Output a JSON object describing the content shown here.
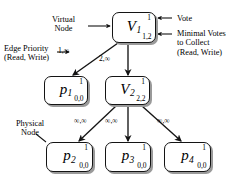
{
  "diagram": {
    "nodes": [
      {
        "id": "V1",
        "label": "V",
        "subscript": "1",
        "vote": "1",
        "minimal_votes": "1,2",
        "kind": "virtual"
      },
      {
        "id": "p1",
        "label": "p",
        "subscript": "1",
        "vote": "1",
        "minimal_votes": "0,0",
        "kind": "physical"
      },
      {
        "id": "V2",
        "label": "V",
        "subscript": "2",
        "vote": "1",
        "minimal_votes": "2,2",
        "kind": "virtual"
      },
      {
        "id": "p2",
        "label": "p",
        "subscript": "2",
        "vote": "1",
        "minimal_votes": "0,0",
        "kind": "physical"
      },
      {
        "id": "p3",
        "label": "p",
        "subscript": "3",
        "vote": "1",
        "minimal_votes": "0,0",
        "kind": "physical"
      },
      {
        "id": "p4",
        "label": "p",
        "subscript": "4",
        "vote": "1",
        "minimal_votes": "0,0",
        "kind": "physical"
      }
    ],
    "edges": [
      {
        "from": "V1",
        "to": "p1",
        "label": "1,∞"
      },
      {
        "from": "V1",
        "to": "V2",
        "label": "2,∞"
      },
      {
        "from": "V2",
        "to": "p2",
        "label": "∞,∞"
      },
      {
        "from": "V2",
        "to": "p3",
        "label": "∞,∞"
      },
      {
        "from": "V2",
        "to": "p4",
        "label": "∞,∞"
      }
    ],
    "annotations": {
      "virtual_node": "Virtual\nNode",
      "edge_priority": "Edge Priority\n(Read, Write)",
      "physical_node": "Physical\nNode",
      "vote": "Vote",
      "minimal_votes": "Minimal Votes\nto Collect\n(Read, Write)"
    },
    "colors": {
      "stroke": "#141414",
      "shadow": "#9a9a9a",
      "background": "#ffffff",
      "text": "#000000"
    }
  }
}
